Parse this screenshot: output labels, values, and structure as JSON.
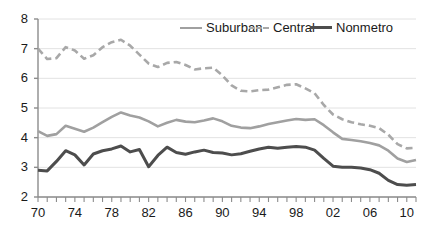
{
  "chart_data": {
    "type": "line",
    "title": "",
    "xlabel": "",
    "ylabel": "",
    "xlim": [
      1970,
      2011
    ],
    "ylim": [
      2,
      8
    ],
    "grid": true,
    "legend_position": "top-center",
    "y_ticks": [
      2,
      3,
      4,
      5,
      6,
      7,
      8
    ],
    "y_tick_labels": [
      "2",
      "3",
      "4",
      "5",
      "6",
      "7",
      "8"
    ],
    "x_tick_labels": [
      "70",
      "74",
      "78",
      "82",
      "86",
      "90",
      "94",
      "98",
      "02",
      "06",
      "10"
    ],
    "x_tick_years": [
      1970,
      1974,
      1978,
      1982,
      1986,
      1990,
      1994,
      1998,
      2002,
      2006,
      2010
    ],
    "x_minor_tick_interval": 1,
    "x": [
      1970,
      1971,
      1972,
      1973,
      1974,
      1975,
      1976,
      1977,
      1978,
      1979,
      1980,
      1981,
      1982,
      1983,
      1984,
      1985,
      1986,
      1987,
      1988,
      1989,
      1990,
      1991,
      1992,
      1993,
      1994,
      1995,
      1996,
      1997,
      1998,
      1999,
      2000,
      2001,
      2002,
      2003,
      2004,
      2005,
      2006,
      2007,
      2008,
      2009,
      2010,
      2011
    ],
    "series": [
      {
        "name": "Suburban",
        "color": "#a0a0a0",
        "style": "solid",
        "width": 2.6,
        "values": [
          4.22,
          4.06,
          4.12,
          4.4,
          4.3,
          4.2,
          4.34,
          4.52,
          4.7,
          4.85,
          4.75,
          4.68,
          4.55,
          4.38,
          4.5,
          4.6,
          4.54,
          4.52,
          4.58,
          4.65,
          4.55,
          4.4,
          4.34,
          4.32,
          4.38,
          4.46,
          4.52,
          4.58,
          4.63,
          4.6,
          4.62,
          4.42,
          4.18,
          3.96,
          3.92,
          3.88,
          3.82,
          3.74,
          3.56,
          3.3,
          3.18,
          3.25
        ]
      },
      {
        "name": "Central",
        "color": "#a8a8a8",
        "style": "dashed",
        "width": 2.6,
        "values": [
          7.0,
          6.65,
          6.68,
          7.05,
          6.94,
          6.66,
          6.78,
          7.05,
          7.22,
          7.3,
          7.1,
          6.8,
          6.5,
          6.38,
          6.52,
          6.55,
          6.45,
          6.3,
          6.34,
          6.36,
          6.1,
          5.76,
          5.58,
          5.56,
          5.6,
          5.62,
          5.7,
          5.78,
          5.8,
          5.66,
          5.5,
          5.1,
          4.78,
          4.62,
          4.52,
          4.45,
          4.4,
          4.32,
          4.1,
          3.78,
          3.64,
          3.66
        ]
      },
      {
        "name": "Nonmetro",
        "color": "#4d4d4d",
        "style": "solid",
        "width": 3.0,
        "values": [
          2.9,
          2.88,
          3.2,
          3.56,
          3.42,
          3.08,
          3.45,
          3.56,
          3.62,
          3.72,
          3.52,
          3.6,
          3.02,
          3.4,
          3.68,
          3.5,
          3.44,
          3.52,
          3.58,
          3.5,
          3.48,
          3.42,
          3.46,
          3.54,
          3.62,
          3.68,
          3.64,
          3.68,
          3.7,
          3.68,
          3.58,
          3.3,
          3.04,
          3.0,
          3.0,
          2.98,
          2.92,
          2.8,
          2.56,
          2.42,
          2.4,
          2.42
        ]
      }
    ]
  },
  "legend": {
    "items": [
      {
        "label": "Suburban"
      },
      {
        "label": "Central"
      },
      {
        "label": "Nonmetro"
      }
    ]
  }
}
